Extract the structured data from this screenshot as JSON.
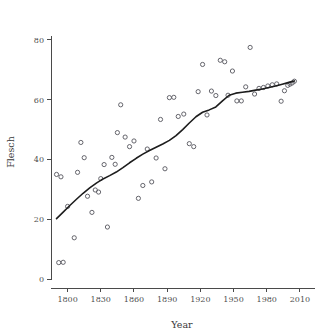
{
  "figure": {
    "background_color": "#ffffff",
    "point_color": "#55555c",
    "curve_color": "#1d1d1d",
    "axis_color": "#4a4a4a"
  },
  "chart_data": {
    "type": "scatter",
    "title": "",
    "xlabel": "Year",
    "ylabel": "Flesch",
    "xlim": [
      1785,
      2020
    ],
    "ylim": [
      -3,
      84
    ],
    "xticks": [
      1800,
      1830,
      1860,
      1890,
      1920,
      1950,
      1980,
      2010
    ],
    "xticklabels": [
      "1800",
      "1830",
      "1860",
      "1890",
      "1920",
      "1950",
      "1980",
      "2010"
    ],
    "yticks": [
      0,
      20,
      40,
      60,
      80
    ],
    "yticklabels": [
      "0",
      "20",
      "40",
      "60",
      "80"
    ],
    "grid": false,
    "legend": false,
    "marker": "open-circle",
    "series": [
      {
        "name": "Flesch reading ease by year",
        "x": [
          1790,
          1792,
          1794,
          1796,
          1800,
          1806,
          1809,
          1812,
          1815,
          1818,
          1822,
          1825,
          1828,
          1830,
          1833,
          1836,
          1840,
          1843,
          1845,
          1848,
          1852,
          1856,
          1860,
          1864,
          1868,
          1872,
          1876,
          1880,
          1884,
          1888,
          1892,
          1896,
          1900,
          1905,
          1910,
          1914,
          1918,
          1922,
          1926,
          1930,
          1934,
          1938,
          1942,
          1945,
          1949,
          1953,
          1957,
          1961,
          1965,
          1969,
          1973,
          1977,
          1981,
          1985,
          1989,
          1993,
          1996,
          1999,
          2001,
          2003,
          2005
        ],
        "y": [
          35.0,
          5.5,
          34.2,
          5.6,
          24.3,
          13.8,
          35.7,
          45.7,
          40.6,
          27.7,
          22.3,
          29.8,
          29.1,
          33.6,
          38.3,
          17.4,
          40.7,
          38.4,
          49.0,
          58.3,
          47.5,
          44.3,
          46.2,
          27.0,
          31.3,
          43.5,
          32.5,
          40.5,
          53.4,
          36.9,
          60.7,
          60.8,
          54.4,
          55.2,
          45.3,
          44.3,
          62.7,
          71.8,
          54.9,
          62.9,
          61.4,
          73.2,
          72.7,
          61.5,
          69.6,
          59.6,
          59.6,
          64.3,
          77.5,
          61.9,
          63.8,
          64.1,
          64.6,
          65.0,
          65.3,
          59.5,
          63.0,
          64.8,
          65.2,
          65.6,
          66.2
        ]
      }
    ],
    "smooth_curve": {
      "name": "loess-fit",
      "x": [
        1790,
        1796,
        1802,
        1808,
        1814,
        1820,
        1826,
        1832,
        1838,
        1844,
        1850,
        1856,
        1862,
        1868,
        1874,
        1880,
        1886,
        1892,
        1898,
        1904,
        1910,
        1916,
        1922,
        1928,
        1934,
        1940,
        1946,
        1952,
        1958,
        1964,
        1970,
        1976,
        1982,
        1988,
        1994,
        2000,
        2005
      ],
      "y": [
        20.2,
        22.4,
        24.6,
        26.7,
        28.7,
        30.5,
        32.1,
        33.5,
        34.6,
        35.8,
        37.3,
        38.9,
        40.4,
        41.8,
        43.0,
        44.1,
        45.2,
        46.4,
        48.0,
        50.0,
        52.2,
        54.3,
        55.8,
        56.6,
        57.6,
        59.6,
        61.5,
        62.2,
        62.5,
        62.8,
        63.2,
        63.6,
        64.1,
        64.6,
        65.2,
        65.8,
        66.3
      ]
    }
  }
}
